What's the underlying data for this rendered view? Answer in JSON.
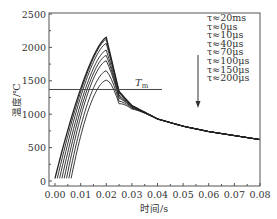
{
  "chart_data": {
    "type": "line",
    "title": "",
    "xlabel": "时间/s",
    "ylabel": "温度/℃",
    "xlim": [
      0.0,
      0.08
    ],
    "ylim": [
      0,
      2500
    ],
    "xticks": [
      "0.00",
      "0.01",
      "0.02",
      "0.03",
      "0.04",
      "0.05",
      "0.06",
      "0.07",
      "0.08"
    ],
    "yticks": [
      "0",
      "500",
      "1000",
      "1500",
      "2000",
      "2500"
    ],
    "grid": false,
    "legend_position": "upper right",
    "legend_arrow": "down",
    "annotation": {
      "text": "T",
      "subscript": "m",
      "value": 1370
    },
    "series": [
      {
        "name": "τ≈20ms",
        "peak_x": 0.02,
        "peak": 2150
      },
      {
        "name": "τ≈0μs",
        "peak_x": 0.02,
        "peak": 2120
      },
      {
        "name": "τ≈10μs",
        "peak_x": 0.02,
        "peak": 2060
      },
      {
        "name": "τ≈40μs",
        "peak_x": 0.02,
        "peak": 1960
      },
      {
        "name": "τ≈70μs",
        "peak_x": 0.02,
        "peak": 1880
      },
      {
        "name": "τ≈100μs",
        "peak_x": 0.02,
        "peak": 1800
      },
      {
        "name": "τ≈150μs",
        "peak_x": 0.02,
        "peak": 1650
      },
      {
        "name": "τ≈200μs",
        "peak_x": 0.02,
        "peak": 1510
      }
    ],
    "cooling_curve": {
      "x": [
        0.02,
        0.025,
        0.03,
        0.04,
        0.05,
        0.06,
        0.07,
        0.08
      ],
      "values": [
        2150,
        1340,
        1130,
        930,
        820,
        740,
        680,
        620
      ]
    },
    "start_value": 40
  }
}
